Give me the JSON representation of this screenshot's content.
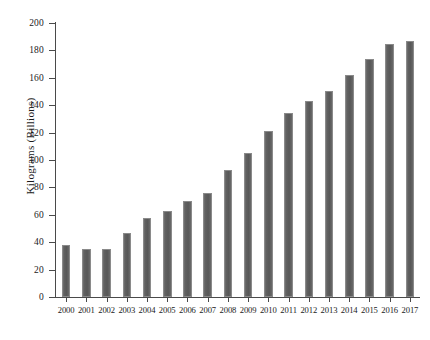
{
  "chart_data": {
    "type": "bar",
    "title": "",
    "subtitle": "",
    "xlabel": "",
    "ylabel": "Kilograms (Billions)",
    "categories": [
      "2000",
      "2001",
      "2002",
      "2003",
      "2004",
      "2005",
      "2006",
      "2007",
      "2008",
      "2009",
      "2010",
      "2011",
      "2012",
      "2013",
      "2014",
      "2015",
      "2016",
      "2017"
    ],
    "values": [
      38,
      35,
      35,
      47,
      57.5,
      63,
      70,
      76,
      93,
      105.5,
      121,
      134,
      143,
      150.5,
      162,
      174,
      184.5,
      187
    ],
    "ylim": [
      0,
      200
    ],
    "y_ticks": [
      0,
      20,
      40,
      60,
      80,
      100,
      120,
      140,
      160,
      180,
      200
    ],
    "y_tick_labels": [
      "0",
      "20",
      "40",
      "60",
      "80",
      "100",
      "120",
      "140",
      "160",
      "180",
      "200"
    ],
    "grid": false,
    "legend": null,
    "legend_position": "none",
    "bar_color": "#5e5e5e",
    "bar_edge_color": "#8a8a8a",
    "axis_color": "#4a4a4a",
    "background_color": "#ffffff",
    "annotations": []
  }
}
